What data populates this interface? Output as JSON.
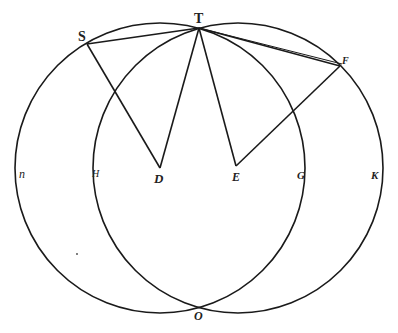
{
  "diagram": {
    "points": {
      "T": {
        "label": "T",
        "x": 199,
        "y": 28
      },
      "O": {
        "label": "O",
        "x": 199,
        "y": 307
      },
      "S": {
        "label": "S",
        "x": 87,
        "y": 44
      },
      "F": {
        "label": "F",
        "x": 340,
        "y": 66
      },
      "D": {
        "label": "D",
        "x": 160,
        "y": 168
      },
      "E": {
        "label": "E",
        "x": 236,
        "y": 166
      }
    },
    "arc_labels": {
      "n": "n",
      "H": "H",
      "G": "G",
      "K": "K"
    },
    "circles": [
      {
        "name": "left-circle",
        "cx": 160,
        "cy": 168,
        "r": 145
      },
      {
        "name": "right-circle",
        "cx": 238,
        "cy": 168,
        "r": 145
      }
    ],
    "stroke_color": "#1a1a1a"
  }
}
